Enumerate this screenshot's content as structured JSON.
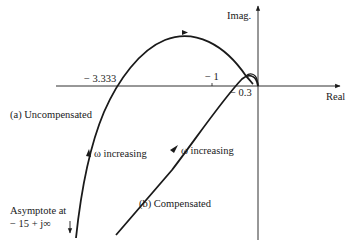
{
  "axes": {
    "real_label": "Real",
    "imag_label": "Imag.",
    "ticks": {
      "t1": "− 3.333",
      "t2": "− 1",
      "t3": "− 0.3"
    }
  },
  "curves": {
    "uncompensated": {
      "label": "(a) Uncompensated",
      "omega_label": "ω increasing"
    },
    "compensated": {
      "label": "(b) Compensated",
      "omega_label": "ω increasing"
    }
  },
  "asymptote": {
    "line1": "Asymptote at",
    "line2": "− 15 + j∞"
  },
  "colors": {
    "ink": "#1a1a1a",
    "background": "#ffffff"
  }
}
